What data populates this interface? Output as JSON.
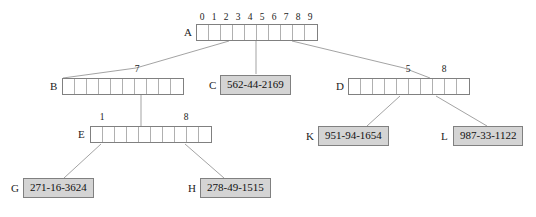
{
  "diagram": {
    "kind": "trie-tree",
    "colors": {
      "node_border": "#808080",
      "cell_divider": "#b0b0b0",
      "leaf_fill": "#d4d4d4",
      "edge": "#999999",
      "text": "#222222",
      "background": "#ffffff"
    },
    "nodes": [
      {
        "id": "A",
        "type": "array",
        "label": "A",
        "cells": 10,
        "index_labels": [
          "0",
          "1",
          "2",
          "3",
          "4",
          "5",
          "6",
          "7",
          "8",
          "9"
        ],
        "show_all_indices": true
      },
      {
        "id": "B",
        "type": "array",
        "label": "B",
        "cells": 10,
        "index_labels": [
          "7"
        ],
        "index_positions": [
          7
        ],
        "show_all_indices": false
      },
      {
        "id": "C",
        "type": "leaf",
        "label": "C",
        "value": "562-44-2169"
      },
      {
        "id": "D",
        "type": "array",
        "label": "D",
        "cells": 10,
        "index_labels": [
          "5",
          "8"
        ],
        "index_positions": [
          5,
          8
        ],
        "show_all_indices": false
      },
      {
        "id": "E",
        "type": "array",
        "label": "E",
        "cells": 10,
        "index_labels": [
          "1",
          "8"
        ],
        "index_positions": [
          1,
          8
        ],
        "show_all_indices": false
      },
      {
        "id": "G",
        "type": "leaf",
        "label": "G",
        "value": "271-16-3624"
      },
      {
        "id": "H",
        "type": "leaf",
        "label": "H",
        "value": "278-49-1515"
      },
      {
        "id": "K",
        "type": "leaf",
        "label": "K",
        "value": "951-94-1654"
      },
      {
        "id": "L",
        "type": "leaf",
        "label": "L",
        "value": "987-33-1122"
      }
    ],
    "edges": [
      {
        "from": "A",
        "from_slot": 2,
        "to": "B"
      },
      {
        "from": "A",
        "from_slot": 5,
        "to": "C"
      },
      {
        "from": "A",
        "from_slot": 8,
        "to": "D"
      },
      {
        "from": "B",
        "from_slot": 7,
        "to": "E"
      },
      {
        "from": "D",
        "from_slot": 5,
        "to": "K"
      },
      {
        "from": "D",
        "from_slot": 8,
        "to": "L"
      },
      {
        "from": "E",
        "from_slot": 1,
        "to": "G"
      },
      {
        "from": "E",
        "from_slot": 8,
        "to": "H"
      }
    ],
    "labels": {
      "A": "A",
      "B": "B",
      "C": "C",
      "D": "D",
      "E": "E",
      "G": "G",
      "H": "H",
      "K": "K",
      "L": "L"
    },
    "values": {
      "C": "562-44-2169",
      "G": "271-16-3624",
      "H": "278-49-1515",
      "K": "951-94-1654",
      "L": "987-33-1122"
    },
    "indices": {
      "A": [
        "0",
        "1",
        "2",
        "3",
        "4",
        "5",
        "6",
        "7",
        "8",
        "9"
      ],
      "B7": "7",
      "D5": "5",
      "D8": "8",
      "E1": "1",
      "E8": "8"
    }
  }
}
